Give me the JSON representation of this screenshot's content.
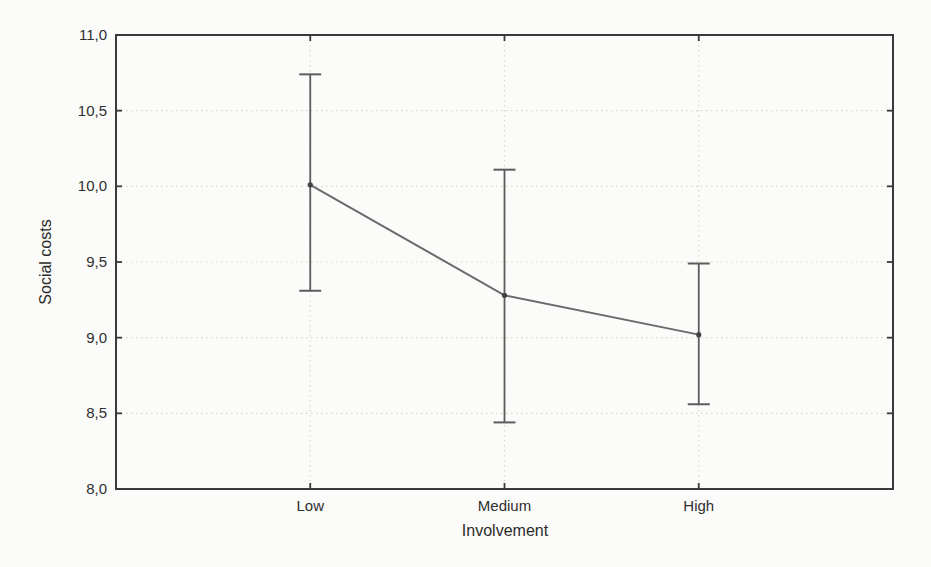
{
  "chart_data": {
    "type": "line",
    "title": "",
    "xlabel": "Involvement",
    "ylabel": "Social costs",
    "categories": [
      "Low",
      "Medium",
      "High"
    ],
    "series": [
      {
        "name": "Social costs mean",
        "values": [
          10.01,
          9.28,
          9.02
        ],
        "error_upper": [
          10.74,
          10.11,
          9.49
        ],
        "error_lower": [
          9.31,
          8.44,
          8.56
        ]
      }
    ],
    "ylim": [
      8.0,
      11.0
    ],
    "ytick_step": 0.5,
    "yticks": [
      {
        "value": 8.0,
        "label": "8,0"
      },
      {
        "value": 8.5,
        "label": "8,5"
      },
      {
        "value": 9.0,
        "label": "9,0"
      },
      {
        "value": 9.5,
        "label": "9,5"
      },
      {
        "value": 10.0,
        "label": "10,0"
      },
      {
        "value": 10.5,
        "label": "10,5"
      },
      {
        "value": 11.0,
        "label": "11,0"
      }
    ],
    "grid": {
      "horizontal": true,
      "vertical_at_categories": true,
      "style": "dotted"
    },
    "legend": "none",
    "marker": "filled-circle",
    "colors": {
      "axis": "#3a3a3a",
      "line": "#6a6a6a",
      "error_bar": "#5c5c5c",
      "marker": "#424242",
      "grid": "#d7d7d4",
      "text": "#2f2f2f",
      "background": "#fbfbf9"
    }
  }
}
